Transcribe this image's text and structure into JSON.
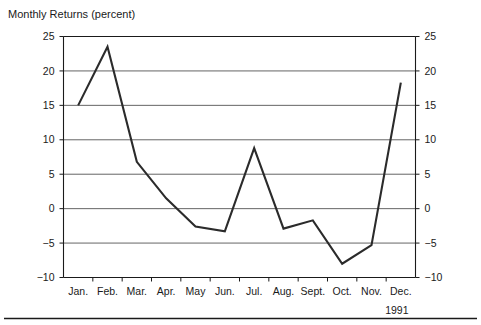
{
  "chart_data": {
    "type": "line",
    "title": "Monthly Returns (percent)",
    "xlabel": "",
    "ylabel": "",
    "year_label": "1991",
    "categories": [
      "Jan.",
      "Feb.",
      "Mar.",
      "Apr.",
      "May",
      "Jun.",
      "Jul.",
      "Aug.",
      "Sept.",
      "Oct.",
      "Nov.",
      "Dec."
    ],
    "values": [
      15.0,
      23.5,
      6.8,
      1.5,
      -2.6,
      -3.3,
      8.8,
      -2.9,
      -1.7,
      -8.0,
      -5.3,
      18.3
    ],
    "series": [
      {
        "name": "Monthly Returns",
        "values": [
          15.0,
          23.5,
          6.8,
          1.5,
          -2.6,
          -3.3,
          8.8,
          -2.9,
          -1.7,
          -8.0,
          -5.3,
          18.3
        ],
        "color": "#2b2b2b"
      }
    ],
    "ylim": [
      -10,
      25
    ],
    "ytick_values": [
      25,
      20,
      15,
      10,
      5,
      0,
      -5,
      -10
    ],
    "ytick_labels_left": [
      "25",
      "20",
      "15",
      "10",
      "5",
      "0",
      "−5",
      "−10"
    ],
    "ytick_labels_right": [
      "25",
      "20",
      "15",
      "10",
      "5",
      "0",
      "−5",
      "−10"
    ],
    "grid": true,
    "legend": false,
    "legend_position": "none",
    "axis_labels_both_sides": true,
    "line_color": "#2b2b2b",
    "grid_color": "#3d3d3d",
    "axis_color": "#1a1a1a",
    "background_color": "#ffffff"
  },
  "figure": {
    "title": "Monthly Returns (percent)",
    "year": "1991",
    "footer_rule": true
  }
}
